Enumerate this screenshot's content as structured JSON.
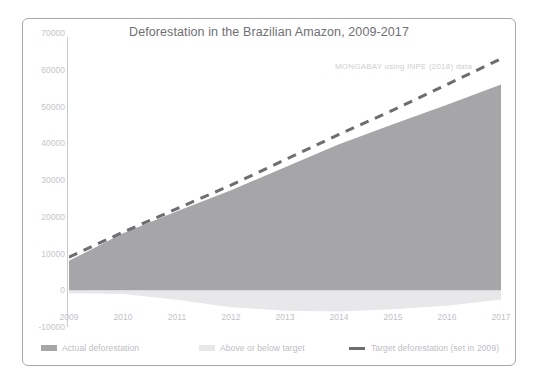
{
  "chart_data": {
    "type": "area",
    "title": "Deforestation in the Brazilian Amazon, 2009-2017",
    "attribution": "MONGABAY using INPE (2018) data",
    "xlabel": "",
    "ylabel": "",
    "categories": [
      "2009",
      "2010",
      "2011",
      "2012",
      "2013",
      "2014",
      "2015",
      "2016",
      "2017"
    ],
    "x": [
      2009,
      2010,
      2011,
      2012,
      2013,
      2014,
      2015,
      2016,
      2017
    ],
    "ylim": [
      -10000,
      70000
    ],
    "ytick_labels": [
      "70000",
      "60000",
      "50000",
      "40000",
      "30000",
      "20000",
      "10000",
      "0",
      "-10000"
    ],
    "ytick_values": [
      70000,
      60000,
      50000,
      40000,
      30000,
      20000,
      10000,
      0,
      -10000
    ],
    "grid": false,
    "legend_position": "bottom",
    "series": [
      {
        "name": "Actual deforestation",
        "type": "area",
        "color": "#a6a6a8",
        "values": [
          8000,
          15500,
          21500,
          27200,
          33500,
          39700,
          45200,
          50500,
          56000
        ]
      },
      {
        "name": "Target deforestation (set in 2009)",
        "type": "line-dashed",
        "color": "#6d6d72",
        "values": [
          9000,
          15800,
          22200,
          28600,
          35500,
          42400,
          49000,
          56000,
          63000
        ]
      },
      {
        "name": "Above or below target",
        "type": "band",
        "color": "#e8e8ea",
        "values": [
          -800,
          -1000,
          -2600,
          -4600,
          -5600,
          -5800,
          -5200,
          -4200,
          -2500
        ]
      }
    ]
  },
  "legend": {
    "items": [
      {
        "label": "Actual deforestation",
        "swatch": "solid-gray"
      },
      {
        "label": "Above or below target",
        "swatch": "light-gray"
      },
      {
        "label": "Target deforestation (set in 2009)",
        "swatch": "dashed-line"
      }
    ]
  },
  "colors": {
    "area_fill": "#a6a6a8",
    "target_line": "#6d6d72",
    "band_fill": "#e8e8ea",
    "axis": "#c9c9ce",
    "tick_text": "#c2c2c7",
    "title_text": "#6f6f74",
    "border": "#a9a9ad"
  }
}
